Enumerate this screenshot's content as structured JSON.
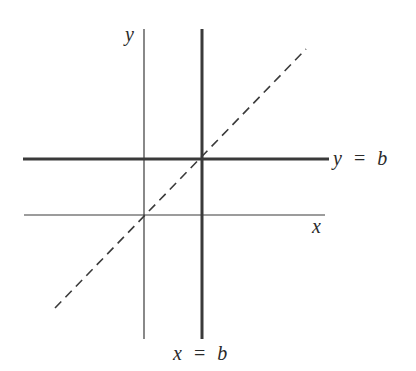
{
  "diagram": {
    "labels": {
      "y_axis": "y",
      "x_axis": "x",
      "horizontal_line_var": "y",
      "horizontal_line_eq": "=",
      "horizontal_line_val": "b",
      "vertical_line_var": "x",
      "vertical_line_eq": "=",
      "vertical_line_val": "b"
    },
    "elements": [
      {
        "name": "y-axis",
        "style": "thin solid vertical"
      },
      {
        "name": "x-axis",
        "style": "thin solid horizontal"
      },
      {
        "name": "line y = b",
        "style": "thick solid horizontal"
      },
      {
        "name": "line x = b",
        "style": "thick solid vertical"
      },
      {
        "name": "line y = x",
        "style": "dashed diagonal through origin and (b,b)"
      }
    ],
    "colors": {
      "line": "#3a3a3a",
      "background": "#ffffff"
    }
  }
}
